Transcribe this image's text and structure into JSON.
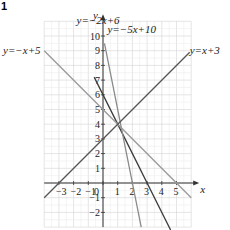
{
  "figure": {
    "number_label": "1"
  },
  "chart_data": {
    "type": "line",
    "title": "",
    "xlabel": "x",
    "ylabel": "y",
    "xlim": [
      -4,
      6
    ],
    "ylim": [
      -3,
      11
    ],
    "grid": true,
    "x_ticks": [
      -3,
      -2,
      -1,
      0,
      1,
      2,
      3,
      4,
      5
    ],
    "y_ticks": [
      -2,
      -1,
      1,
      2,
      3,
      4,
      5,
      6,
      7,
      8,
      9,
      10
    ],
    "series": [
      {
        "name": "y = -2x + 6",
        "slope": -2,
        "intercept": 6,
        "color": "#3a3a3a",
        "x_range": [
          -0.6,
          4.6
        ]
      },
      {
        "name": "y = -5x + 10",
        "slope": -5,
        "intercept": 10,
        "color": "#8a8a8a",
        "x_range": [
          0.1,
          2.6
        ]
      },
      {
        "name": "y = -x + 5",
        "slope": -1,
        "intercept": 5,
        "color": "#9a9a9a",
        "x_range": [
          -4,
          6
        ]
      },
      {
        "name": "y = x + 3",
        "slope": 1,
        "intercept": 3,
        "color": "#555555",
        "x_range": [
          -4,
          5.9
        ]
      }
    ],
    "annotations": [
      {
        "text": "y = -2x + 6",
        "x": -1.8,
        "y": 10.8
      },
      {
        "text": "y = -5x + 10",
        "x": 0.3,
        "y": 10.2
      },
      {
        "text": "y = -x + 5",
        "x": -6.8,
        "y": 8.8
      },
      {
        "text": "y = x + 3",
        "x": 5.9,
        "y": 8.8
      }
    ],
    "intersection": {
      "x": 1,
      "y": 4
    }
  }
}
